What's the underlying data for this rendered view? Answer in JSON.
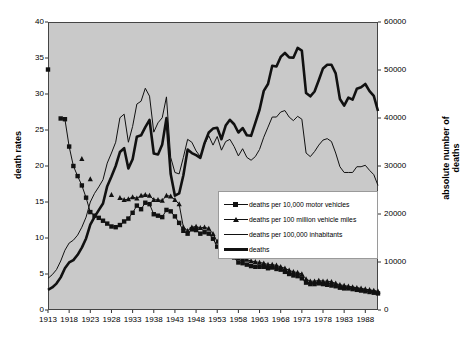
{
  "chart_data": {
    "type": "line",
    "title": "",
    "xlabel": "",
    "ylabel": "death rates",
    "ylabel_right": "absolute number of deaths",
    "xlim": [
      1913,
      1991
    ],
    "ylim": [
      0,
      40
    ],
    "ylim_right": [
      0,
      60000
    ],
    "grid": false,
    "legend_position": "center-right",
    "xticks": [
      "1913",
      "1918",
      "1923",
      "1928",
      "1933",
      "1938",
      "1943",
      "1948",
      "1953",
      "1958",
      "1963",
      "1968",
      "1973",
      "1978",
      "1983",
      "1988"
    ],
    "yticks_left": [
      "0",
      "5",
      "10",
      "15",
      "20",
      "25",
      "30",
      "35",
      "40"
    ],
    "yticks_right": [
      "0",
      "10000",
      "20000",
      "30000",
      "40000",
      "50000",
      "60000"
    ],
    "x": [
      1913,
      1914,
      1915,
      1916,
      1917,
      1918,
      1919,
      1920,
      1921,
      1922,
      1923,
      1924,
      1925,
      1926,
      1927,
      1928,
      1929,
      1930,
      1931,
      1932,
      1933,
      1934,
      1935,
      1936,
      1937,
      1938,
      1939,
      1940,
      1941,
      1942,
      1943,
      1944,
      1945,
      1946,
      1947,
      1948,
      1949,
      1950,
      1951,
      1952,
      1953,
      1954,
      1955,
      1956,
      1957,
      1958,
      1959,
      1960,
      1961,
      1962,
      1963,
      1964,
      1965,
      1966,
      1967,
      1968,
      1969,
      1970,
      1971,
      1972,
      1973,
      1974,
      1975,
      1976,
      1977,
      1978,
      1979,
      1980,
      1981,
      1982,
      1983,
      1984,
      1985,
      1986,
      1987,
      1988,
      1989,
      1990,
      1991
    ],
    "series": [
      {
        "name": "deaths per 10,000 motor vehicles",
        "marker": "square",
        "line_width": "thin",
        "axis": "left",
        "values": [
          33.4,
          null,
          null,
          26.6,
          26.5,
          22.7,
          20.0,
          18.6,
          17.3,
          15.6,
          13.6,
          13.1,
          12.8,
          12.4,
          12.0,
          11.6,
          11.5,
          11.8,
          12.3,
          12.7,
          13.5,
          14.5,
          14.0,
          14.9,
          14.7,
          13.3,
          13.1,
          12.9,
          13.9,
          13.7,
          13.0,
          12.1,
          11.0,
          10.6,
          11.2,
          11.1,
          10.6,
          10.8,
          10.6,
          9.9,
          8.8,
          8.0,
          7.8,
          7.7,
          7.3,
          6.6,
          6.5,
          6.3,
          6.1,
          6.0,
          6.0,
          6.0,
          5.8,
          5.9,
          5.7,
          5.6,
          5.3,
          5.0,
          4.8,
          4.7,
          4.4,
          3.8,
          3.6,
          3.6,
          3.7,
          3.6,
          3.5,
          3.4,
          3.3,
          3.1,
          3.0,
          3.0,
          2.9,
          2.8,
          2.7,
          2.6,
          2.5,
          2.4,
          2.3
        ]
      },
      {
        "name": "deaths per 100 million vehicle miles",
        "marker": "triangle",
        "line_width": "thin",
        "axis": "left",
        "values": [
          null,
          null,
          null,
          null,
          null,
          null,
          null,
          null,
          21.0,
          null,
          18.2,
          null,
          null,
          null,
          null,
          16.0,
          null,
          15.6,
          15.3,
          15.4,
          15.7,
          15.5,
          15.9,
          16.0,
          15.9,
          15.3,
          15.3,
          15.2,
          15.9,
          15.8,
          15.3,
          14.7,
          11.5,
          11.0,
          11.5,
          11.6,
          11.4,
          11.5,
          11.3,
          10.6,
          9.5,
          8.6,
          8.4,
          8.3,
          8.0,
          7.2,
          7.1,
          7.0,
          6.8,
          6.7,
          6.6,
          6.5,
          6.3,
          6.3,
          6.2,
          6.0,
          5.8,
          5.5,
          5.3,
          5.2,
          5.0,
          4.3,
          4.0,
          4.0,
          4.1,
          4.0,
          4.0,
          3.9,
          3.7,
          3.5,
          3.4,
          3.3,
          3.2,
          3.1,
          3.0,
          2.9,
          2.8,
          2.7,
          2.6
        ]
      },
      {
        "name": "deaths per 100,000 inhabitants",
        "marker": "none",
        "line_width": "thin",
        "axis": "left",
        "values": [
          4.4,
          4.9,
          5.6,
          6.8,
          8.3,
          9.3,
          9.7,
          10.4,
          11.5,
          12.9,
          15.0,
          16.2,
          17.1,
          18.1,
          20.4,
          21.8,
          23.3,
          26.7,
          27.2,
          23.3,
          25.5,
          28.6,
          29.0,
          30.8,
          29.7,
          24.7,
          26.0,
          26.7,
          29.6,
          21.2,
          19.1,
          18.9,
          21.2,
          23.7,
          23.3,
          22.1,
          21.3,
          23.0,
          24.2,
          22.9,
          24.1,
          22.2,
          23.4,
          23.7,
          22.7,
          21.4,
          22.4,
          21.2,
          20.8,
          21.3,
          22.3,
          24.0,
          25.4,
          26.8,
          26.8,
          27.5,
          27.7,
          26.8,
          26.3,
          26.9,
          26.5,
          21.8,
          21.3,
          22.0,
          22.9,
          23.6,
          23.8,
          23.4,
          21.8,
          19.9,
          19.1,
          19.1,
          19.1,
          19.9,
          19.9,
          20.1,
          19.4,
          18.8,
          17.3
        ]
      },
      {
        "name": "deaths",
        "marker": "none",
        "line_width": "thick",
        "axis": "right",
        "values": [
          4200,
          4700,
          5500,
          6800,
          8700,
          9900,
          10400,
          11500,
          13000,
          14900,
          17800,
          19400,
          20800,
          22200,
          25800,
          27800,
          30000,
          32900,
          33700,
          29500,
          31400,
          36100,
          36400,
          38100,
          39600,
          32600,
          32400,
          34500,
          39969,
          28309,
          23823,
          24282,
          28076,
          33411,
          32697,
          32259,
          31701,
          34763,
          36996,
          37794,
          37955,
          35586,
          38426,
          39628,
          38702,
          36981,
          37910,
          36399,
          36285,
          38980,
          41723,
          45645,
          47089,
          50894,
          50724,
          52725,
          53543,
          52627,
          52542,
          54589,
          54052,
          45196,
          44525,
          45523,
          47878,
          50331,
          51093,
          51091,
          49301,
          43945,
          42589,
          44257,
          43825,
          46087,
          46390,
          47087,
          45582,
          44599,
          41462
        ]
      }
    ]
  },
  "axes": {
    "left_title": "death rates",
    "right_title": "absolute number of deaths"
  }
}
